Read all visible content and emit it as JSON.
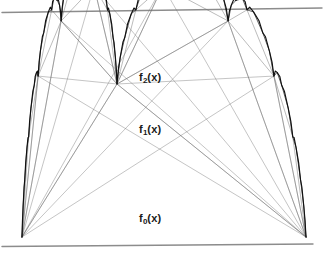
{
  "figure": {
    "type": "diagram",
    "canvas": {
      "width": 327,
      "height": 256,
      "background": "#ffffff"
    },
    "colors": {
      "rule": "#8c8c8c",
      "construction_line": "#6e6e6e",
      "curve": "#111111",
      "label": "#1a1a1a"
    },
    "rules": [
      {
        "name": "top-rule",
        "x1": 2,
        "y1": 12.5,
        "x2": 322,
        "y2": 8.0,
        "width": 1.4
      },
      {
        "name": "bottom-rule",
        "x1": 2,
        "y1": 246.5,
        "x2": 313,
        "y2": 244.0,
        "width": 1.4
      }
    ],
    "base": {
      "left_x": 22,
      "right_x": 306,
      "y": 237
    },
    "apex": {
      "x": 117,
      "y": 84
    },
    "split_ratio": 0.412,
    "decay": 0.47,
    "iterations": 6,
    "construction_levels": 3,
    "labels": [
      {
        "name": "label-f2",
        "base": "f",
        "sub": "2",
        "arg": "(x)",
        "x": 139,
        "y": 72
      },
      {
        "name": "label-f1",
        "base": "f",
        "sub": "1",
        "arg": "(x)",
        "x": 139,
        "y": 124
      },
      {
        "name": "label-f0",
        "base": "f",
        "sub": "0",
        "arg": "(x)",
        "x": 139,
        "y": 213
      }
    ],
    "chart_data": {
      "type": "line",
      "title": "",
      "xlabel": "",
      "ylabel": "",
      "grid": false,
      "legend": "inline-annotations",
      "series": [
        {
          "name": "f0(x)",
          "description": "single tent: baseline triangle from left base to apex to right base"
        },
        {
          "name": "f1(x)",
          "description": "two tents: peaks added on each half of f0"
        },
        {
          "name": "f2(x)",
          "description": "four tents: peaks added on each half of f1"
        },
        {
          "name": "f_inf(x)",
          "description": "limit curve after 6 refinements, nowhere differentiable"
        }
      ],
      "annotations": [
        "f0(x)",
        "f1(x)",
        "f2(x)"
      ]
    }
  }
}
